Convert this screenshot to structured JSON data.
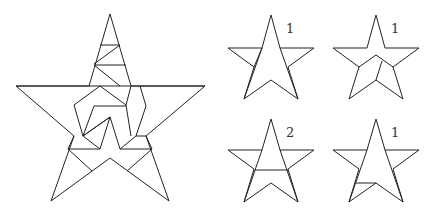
{
  "figure": {
    "small_stars": [
      {
        "id": "star-a",
        "count_label": "1",
        "variant": "outline-arms"
      },
      {
        "id": "star-b",
        "count_label": "1",
        "variant": "inner-notch-cuts"
      },
      {
        "id": "star-c",
        "count_label": "2",
        "variant": "horizontal-band"
      },
      {
        "id": "star-d",
        "count_label": "1",
        "variant": "lower-left-cut"
      }
    ]
  }
}
